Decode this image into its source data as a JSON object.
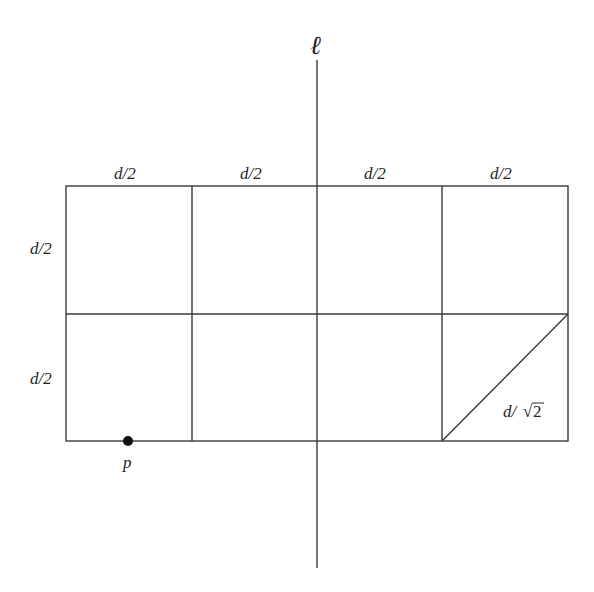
{
  "diagram": {
    "line_label": "ℓ",
    "grid": {
      "rows": 2,
      "cols": 4
    },
    "top_labels": [
      "d/2",
      "d/2",
      "d/2",
      "d/2"
    ],
    "side_labels": [
      "d/2",
      "d/2"
    ],
    "diagonal_label_prefix": "d/",
    "diagonal_label_radical": "√",
    "diagonal_label_radicand": "2",
    "point_label": "p"
  },
  "colors": {
    "line": "#3a3a3a",
    "point": "#111111",
    "text": "#222222"
  }
}
